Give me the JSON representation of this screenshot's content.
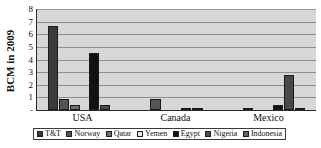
{
  "chart_data": {
    "type": "bar",
    "title": "",
    "subtitle": "",
    "xlabel": "",
    "ylabel": "BCM in 2009",
    "categories": [
      "USA",
      "Canada",
      "Mexico"
    ],
    "ylim": [
      0,
      8
    ],
    "ytick_labels": [
      "-",
      "1",
      "2",
      "3",
      "4",
      "5",
      "6",
      "7",
      "8"
    ],
    "ytick_values": [
      0,
      1,
      2,
      3,
      4,
      5,
      6,
      7,
      8
    ],
    "grid": true,
    "legend_position": "bottom",
    "series": [
      {
        "name": "T&T",
        "color": "#3b3b3b",
        "values": [
          6.65,
          0,
          0
        ]
      },
      {
        "name": "Norway",
        "color": "#555555",
        "values": [
          0.85,
          0.85,
          0.15
        ]
      },
      {
        "name": "Qatar",
        "color": "#6f6f6f",
        "values": [
          0.4,
          0,
          0
        ]
      },
      {
        "name": "Yemen",
        "color": "#e8e8e8",
        "values": [
          0,
          0,
          0
        ]
      },
      {
        "name": "Egypt",
        "color": "#111111",
        "values": [
          4.55,
          0.1,
          0.4
        ]
      },
      {
        "name": "Nigeria",
        "color": "#4a4a4a",
        "values": [
          0.4,
          0.1,
          2.75
        ]
      },
      {
        "name": "Indonesia",
        "color": "#606060",
        "values": [
          0,
          0,
          0.1
        ]
      }
    ]
  },
  "figure": {
    "plot_background": "#d7d7d7",
    "gridline_color": "#8e8e8e",
    "axis_color": "#2a2a2a",
    "legend_border": "#3a3a3a"
  }
}
